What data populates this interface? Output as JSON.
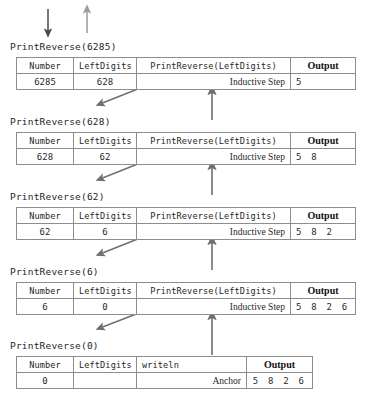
{
  "diagram": {
    "top_arrows": [
      {
        "name": "descent-arrow",
        "direction": "down",
        "color": "#4a4a4a"
      },
      {
        "name": "ascent-arrow",
        "direction": "up",
        "color": "#9a9a9a"
      }
    ],
    "columns": {
      "number": "Number",
      "left_digits": "LeftDigits",
      "recursive_call": "PrintReverse(LeftDigits)",
      "anchor_call": "writeln",
      "output": "Output"
    },
    "step_labels": {
      "inductive": "Inductive Step",
      "anchor": "Anchor"
    },
    "frames": [
      {
        "caption": "PrintReverse(6285)",
        "number": "6285",
        "left_digits": "628",
        "call_header": "PrintReverse(LeftDigits)",
        "step": "Inductive Step",
        "output_header": "Output",
        "output": "5"
      },
      {
        "caption": "PrintReverse(628)",
        "number": "628",
        "left_digits": "62",
        "call_header": "PrintReverse(LeftDigits)",
        "step": "Inductive Step",
        "output_header": "Output",
        "output": "5 8"
      },
      {
        "caption": "PrintReverse(62)",
        "number": "62",
        "left_digits": "6",
        "call_header": "PrintReverse(LeftDigits)",
        "step": "Inductive Step",
        "output_header": "Output",
        "output": "5 8 2"
      },
      {
        "caption": "PrintReverse(6)",
        "number": "6",
        "left_digits": "0",
        "call_header": "PrintReverse(LeftDigits)",
        "step": "Inductive Step",
        "output_header": "Output",
        "output": "5 8 2 6"
      },
      {
        "caption": "PrintReverse(0)",
        "number": "0",
        "left_digits": "",
        "call_header": "writeln",
        "step": "Anchor",
        "output_header": "Output",
        "output": "5 8 2 6"
      }
    ]
  }
}
